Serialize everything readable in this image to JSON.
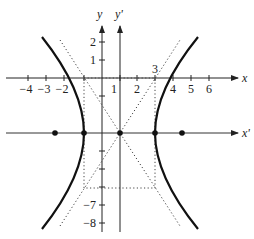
{
  "figure": {
    "axes": {
      "x_label": "x",
      "y_label": "y",
      "x_prime_label": "x'",
      "y_prime_label": "y'"
    },
    "x_ticks": [
      {
        "value": -4,
        "label": "−4"
      },
      {
        "value": -3,
        "label": "−3"
      },
      {
        "value": -2,
        "label": "−2"
      },
      {
        "value": 1,
        "label": "1"
      },
      {
        "value": 2,
        "label": "2"
      },
      {
        "value": 4,
        "label": "4"
      },
      {
        "value": 5,
        "label": "5"
      },
      {
        "value": 6,
        "label": "6"
      }
    ],
    "x_extra_label": {
      "value": 3,
      "label": "3"
    },
    "y_ticks": [
      {
        "value": 2,
        "label": "2"
      },
      {
        "value": 1,
        "label": "1"
      },
      {
        "value": -7,
        "label": "−7"
      },
      {
        "value": -8,
        "label": "−8"
      }
    ],
    "center": {
      "x": 1,
      "y": -3
    },
    "vertices": [
      {
        "x": -1,
        "y": -3
      },
      {
        "x": 3,
        "y": -3
      }
    ],
    "foci": [
      {
        "x": -2.6,
        "y": -3
      },
      {
        "x": 4.6,
        "y": -3
      }
    ],
    "asymptotes": "dotted lines through center",
    "box": "dotted rectangle x from -1 to 3, y from -6 to 0",
    "colors": {
      "curve": "#111111",
      "axis": "#222222",
      "dotted": "#444444"
    }
  }
}
